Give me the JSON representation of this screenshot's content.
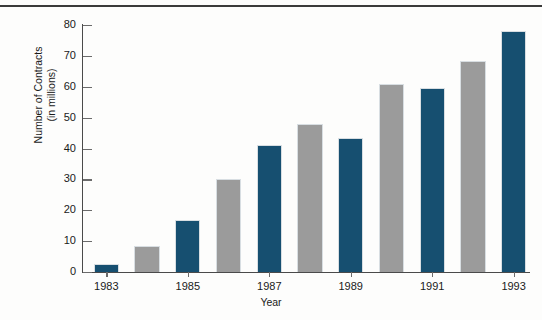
{
  "chart_data": {
    "type": "bar",
    "title": "",
    "xlabel": "Year",
    "ylabel_line1": "Number of Contracts",
    "ylabel_line2": "(in millions)",
    "ylim": [
      0,
      80
    ],
    "yticks": [
      0,
      10,
      20,
      30,
      40,
      50,
      60,
      70,
      80
    ],
    "ytick_labels": [
      "0",
      "10",
      "20",
      "30",
      "40",
      "50",
      "60",
      "70",
      "80"
    ],
    "grid": false,
    "legend": "none",
    "x_tick_labels": [
      "1983",
      "1985",
      "1987",
      "1989",
      "1991",
      "1993"
    ],
    "categories": [
      "1983",
      "1984",
      "1985",
      "1986",
      "1987",
      "1988",
      "1989",
      "1990",
      "1991",
      "1992",
      "1993"
    ],
    "values": [
      2.5,
      8.5,
      17,
      30,
      41,
      48,
      43.5,
      61,
      59.5,
      68.5,
      78
    ],
    "bar_colors": [
      "navy",
      "gray",
      "navy",
      "gray",
      "navy",
      "gray",
      "navy",
      "gray",
      "navy",
      "gray",
      "navy"
    ],
    "colors": {
      "navy": "#164f70",
      "gray": "#9b9b9b",
      "axis": "#4a4a4a",
      "text": "#1a1a1a",
      "background": "#fdfdfc"
    }
  }
}
